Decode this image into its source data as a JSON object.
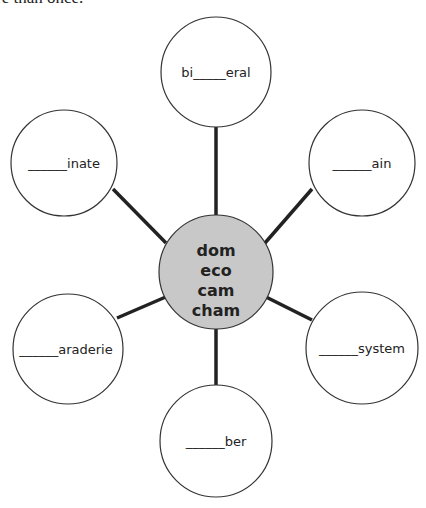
{
  "instruction_fragment": "re than once.",
  "hub": {
    "roots": [
      "dom",
      "eco",
      "cam",
      "cham"
    ],
    "fill": "#c8c8c8"
  },
  "spokes": [
    {
      "position": "top",
      "prefix": "bi",
      "blank": "_____",
      "suffix": "eral"
    },
    {
      "position": "top-left",
      "prefix": "",
      "blank": "______",
      "suffix": "inate"
    },
    {
      "position": "top-right",
      "prefix": "",
      "blank": "______",
      "suffix": "ain"
    },
    {
      "position": "bottom-left",
      "prefix": "",
      "blank": "______",
      "suffix": "araderie"
    },
    {
      "position": "bottom-right",
      "prefix": "",
      "blank": "______",
      "suffix": "system"
    },
    {
      "position": "bottom",
      "prefix": "",
      "blank": "______",
      "suffix": "ber"
    }
  ]
}
